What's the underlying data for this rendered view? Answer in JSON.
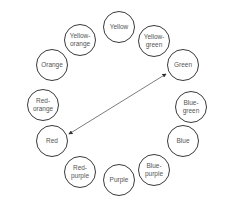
{
  "diagram": {
    "type": "color-wheel",
    "nodes": [
      {
        "label": "Yellow",
        "x": 119,
        "y": 27
      },
      {
        "label": "Yellow-\ngreen",
        "x": 154,
        "y": 41
      },
      {
        "label": "Green",
        "x": 183,
        "y": 65
      },
      {
        "label": "Blue-\ngreen",
        "x": 191,
        "y": 107
      },
      {
        "label": "Blue",
        "x": 183,
        "y": 141
      },
      {
        "label": "Blue-\npurple",
        "x": 154,
        "y": 170
      },
      {
        "label": "Purple",
        "x": 119,
        "y": 180
      },
      {
        "label": "Red-\npurple",
        "x": 80,
        "y": 172
      },
      {
        "label": "Red",
        "x": 52,
        "y": 141
      },
      {
        "label": "Red-\norange",
        "x": 43,
        "y": 105
      },
      {
        "label": "Orange",
        "x": 52,
        "y": 65
      },
      {
        "label": "Yellow-\norange",
        "x": 80,
        "y": 40
      }
    ],
    "connection": {
      "from": "Red",
      "to": "Green",
      "type": "double-arrow"
    }
  }
}
